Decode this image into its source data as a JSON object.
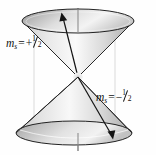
{
  "figure": {
    "background_color": "#fefefe",
    "width": 156,
    "height": 155
  },
  "labels": {
    "upper": {
      "variable": "m",
      "subscript": "s",
      "equals": "=",
      "sign": "+",
      "numerator": "1",
      "denominator": "2",
      "full_text": "m_s = +1/2"
    },
    "lower": {
      "variable": "m",
      "subscript": "s",
      "equals": "=",
      "sign": "−",
      "numerator": "1",
      "denominator": "2",
      "full_text": "m_s = -1/2"
    }
  },
  "geometry": {
    "apex": {
      "x": 78,
      "y": 77
    },
    "upper_cone": {
      "name": "spin-up-cone",
      "ellipse_center_x": 78,
      "ellipse_center_y": 21,
      "ellipse_rx": 56,
      "ellipse_ry": 12,
      "orientation": "inverted"
    },
    "lower_cone": {
      "name": "spin-down-cone",
      "ellipse_center_x": 74,
      "ellipse_center_y": 133,
      "ellipse_rx": 58,
      "ellipse_ry": 12,
      "orientation": "upright"
    },
    "axis": {
      "name": "vertical-axis",
      "x": 78,
      "y_top": 8,
      "y_bottom": 150
    },
    "guide_lines": [
      {
        "x": 34,
        "y_top": 21,
        "y_bottom": 140
      },
      {
        "x": 115,
        "y_top": 21,
        "y_bottom": 140
      }
    ],
    "vectors": [
      {
        "name": "spin-up-vector",
        "from_x": 78,
        "from_y": 77,
        "to_x": 62,
        "to_y": 16,
        "direction": "up-left-rim"
      },
      {
        "name": "spin-down-vector",
        "from_x": 78,
        "from_y": 77,
        "to_x": 112,
        "to_y": 139,
        "direction": "down-right-rim"
      }
    ]
  },
  "colors": {
    "stroke": "#1a1a1a",
    "cone_light": "#fbfbfb",
    "cone_mid": "#d0d0d0",
    "cone_dark": "#8e8e8e",
    "ellipse_light": "#f2f2f2",
    "ellipse_dark": "#9a9a9a",
    "guide": "#cfcfcf",
    "axis": "#8a8a8a",
    "label_text": "#111111"
  }
}
